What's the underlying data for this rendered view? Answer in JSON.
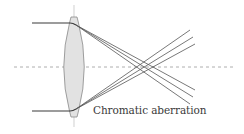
{
  "diagram": {
    "caption": "Chromatic aberration",
    "colors": {
      "ray": "#555555",
      "ray_dark": "#3a3a3a",
      "lens_fill": "#e2e2e2",
      "lens_stroke": "#8a8a8a",
      "axis": "#9a9a9a",
      "center_line": "#bbbbbb"
    },
    "elements": [
      "incoming-ray-top",
      "incoming-ray-bottom",
      "converging-lens",
      "optical-axis",
      "lens-center-line",
      "refracted-rays-top",
      "refracted-rays-bottom"
    ]
  }
}
